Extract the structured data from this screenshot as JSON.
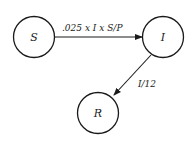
{
  "nodes": {
    "s": {
      "label": "S"
    },
    "i": {
      "label": "I"
    },
    "r": {
      "label": "R"
    }
  },
  "edges": {
    "s_to_i": {
      "label": ".025 x I x S/P"
    },
    "i_to_r": {
      "label": "I/12"
    }
  },
  "colors": {
    "stroke": "#1a1a1a",
    "background": "#ffffff"
  }
}
